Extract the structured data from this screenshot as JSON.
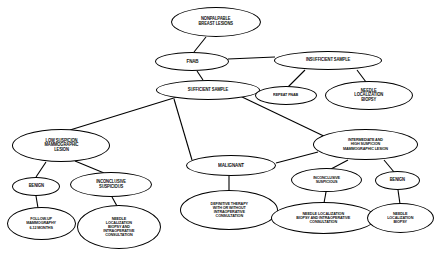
{
  "diagram": {
    "background_color": "#ffffff",
    "node_border_color": "#000000",
    "node_fill_color": "#ffffff",
    "edge_color": "#000000",
    "nodes": [
      {
        "id": "nonpalpable",
        "label": "NONPALPABLE\nBREAST LESIONS",
        "x": 171,
        "y": 7,
        "w": 90,
        "h": 30,
        "size": "sm"
      },
      {
        "id": "fnab",
        "label": "FNAB",
        "x": 155,
        "y": 52,
        "w": 74,
        "h": 19,
        "size": "md"
      },
      {
        "id": "insufficient",
        "label": "INSUFFICIENT SAMPLE",
        "x": 274,
        "y": 51,
        "w": 108,
        "h": 19,
        "size": "sm"
      },
      {
        "id": "sufficient",
        "label": "SUFFICIENT SAMPLE",
        "x": 156,
        "y": 80,
        "w": 104,
        "h": 20,
        "size": "sm"
      },
      {
        "id": "repeat-fnab",
        "label": "REPEAT FNAB",
        "x": 255,
        "y": 86,
        "w": 62,
        "h": 19,
        "size": "xs"
      },
      {
        "id": "nlb-top",
        "label": "NEEDLE\nLOCALIZATION\nBIOPSY",
        "x": 325,
        "y": 81,
        "w": 88,
        "h": 29,
        "size": "sm"
      },
      {
        "id": "low-suspicion",
        "label": "LOW SUSPICION\nMAMMOGRAPHIC\nLESION",
        "x": 12,
        "y": 129,
        "w": 98,
        "h": 33,
        "size": "sm"
      },
      {
        "id": "malignant",
        "label": "MALIGNANT",
        "x": 186,
        "y": 155,
        "w": 90,
        "h": 21,
        "size": "md"
      },
      {
        "id": "intermediate-high",
        "label": "INTERMEDIATE AND\nHIGH SUSPICION\nMAMMOGRAPHIC LESION",
        "x": 313,
        "y": 129,
        "w": 105,
        "h": 31,
        "size": "xs"
      },
      {
        "id": "benign-left",
        "label": "BENIGN",
        "x": 12,
        "y": 177,
        "w": 48,
        "h": 19,
        "size": "sm"
      },
      {
        "id": "inconclusive-left",
        "label": "INCONCLUSIVE\nSUSPICIOUS",
        "x": 70,
        "y": 172,
        "w": 82,
        "h": 25,
        "size": "sm"
      },
      {
        "id": "inconclusive-right",
        "label": "INCONCLUSIVE\nSUSPICIOUS",
        "x": 291,
        "y": 168,
        "w": 71,
        "h": 24,
        "size": "xs"
      },
      {
        "id": "benign-right",
        "label": "BENIGN",
        "x": 375,
        "y": 171,
        "w": 45,
        "h": 19,
        "size": "sm"
      },
      {
        "id": "followup",
        "label": "FOLLOW-UP\nMAMMOGRAPHY\n6-12 MONTHS",
        "x": 7,
        "y": 207,
        "w": 69,
        "h": 33,
        "size": "xs"
      },
      {
        "id": "nlb-intraop-left",
        "label": "NEEDLE\nLOCALIZATION\nBIOPSY AND\nINTRAOPERATIVE\nCONSULTATION",
        "x": 77,
        "y": 205,
        "w": 84,
        "h": 44,
        "size": "xs"
      },
      {
        "id": "definitive-therapy",
        "label": "DEFINITIVE THERAPY\nWITH OR WITHOUT\nINTRAOPERATIVE\nCONSULTATION",
        "x": 180,
        "y": 190,
        "w": 98,
        "h": 40,
        "size": "xs"
      },
      {
        "id": "nlb-intraop-right",
        "label": "NEEDLE LOCALIZATION\nBIOPSY AND INTRAOPERATIVE\nCONSULTATION",
        "x": 271,
        "y": 202,
        "w": 105,
        "h": 32,
        "size": "xs"
      },
      {
        "id": "nlb-bottom-right",
        "label": "NEEDLE\nLOCALIZATION\nBIOPSY",
        "x": 367,
        "y": 203,
        "w": 67,
        "h": 30,
        "size": "xs"
      }
    ],
    "edges": [
      {
        "from": "nonpalpable",
        "to": "fnab",
        "x1": 206,
        "y1": 37,
        "x2": 194,
        "y2": 52
      },
      {
        "from": "fnab",
        "to": "insufficient",
        "x1": 228,
        "y1": 59,
        "x2": 275,
        "y2": 57
      },
      {
        "from": "fnab",
        "to": "sufficient",
        "x1": 197,
        "y1": 71,
        "x2": 203,
        "y2": 80
      },
      {
        "from": "insufficient",
        "to": "repeat-fnab",
        "x1": 305,
        "y1": 70,
        "x2": 288,
        "y2": 87
      },
      {
        "from": "insufficient",
        "to": "nlb-top",
        "x1": 357,
        "y1": 70,
        "x2": 366,
        "y2": 82
      },
      {
        "from": "sufficient",
        "to": "low-suspicion",
        "x1": 177,
        "y1": 97,
        "x2": 70,
        "y2": 130
      },
      {
        "from": "sufficient",
        "to": "malignant",
        "x1": 174,
        "y1": 99,
        "x2": 192,
        "y2": 160
      },
      {
        "from": "sufficient",
        "to": "intermediate-high",
        "x1": 240,
        "y1": 96,
        "x2": 330,
        "y2": 139
      },
      {
        "from": "low-suspicion",
        "to": "benign-left",
        "x1": 46,
        "y1": 162,
        "x2": 36,
        "y2": 177
      },
      {
        "from": "low-suspicion",
        "to": "inconclusive-left",
        "x1": 75,
        "y1": 161,
        "x2": 104,
        "y2": 173
      },
      {
        "from": "benign-left",
        "to": "followup",
        "x1": 36,
        "y1": 196,
        "x2": 38,
        "y2": 208
      },
      {
        "from": "inconclusive-left",
        "to": "nlb-intraop-left",
        "x1": 112,
        "y1": 197,
        "x2": 117,
        "y2": 206
      },
      {
        "from": "malignant",
        "to": "definitive-therapy",
        "x1": 229,
        "y1": 176,
        "x2": 229,
        "y2": 190
      },
      {
        "from": "intermediate-high",
        "to": "malignant",
        "x1": 318,
        "y1": 152,
        "x2": 276,
        "y2": 163
      },
      {
        "from": "intermediate-high",
        "to": "inconclusive-right",
        "x1": 348,
        "y1": 160,
        "x2": 331,
        "y2": 169
      },
      {
        "from": "intermediate-high",
        "to": "benign-right",
        "x1": 384,
        "y1": 160,
        "x2": 394,
        "y2": 172
      },
      {
        "from": "inconclusive-right",
        "to": "nlb-intraop-right",
        "x1": 326,
        "y1": 192,
        "x2": 324,
        "y2": 203
      },
      {
        "from": "benign-right",
        "to": "nlb-bottom-right",
        "x1": 398,
        "y1": 190,
        "x2": 400,
        "y2": 204
      }
    ]
  }
}
